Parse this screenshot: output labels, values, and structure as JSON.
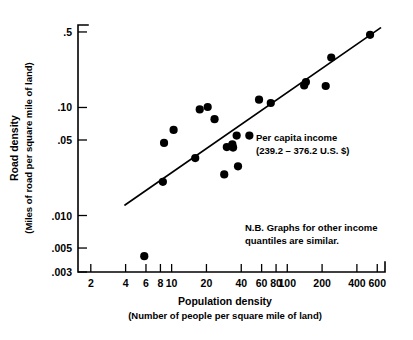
{
  "chart_data": {
    "type": "scatter",
    "title": "",
    "xlabel": "Population density",
    "xlabel_sub": "(Number of people per square mile of land)",
    "ylabel": "Road density",
    "ylabel_sub": "(Miles of road per square mile of land)",
    "xscale": "log",
    "yscale": "log",
    "xlim": [
      1.55,
      700
    ],
    "ylim": [
      0.003,
      0.58
    ],
    "grid": false,
    "legend": "none",
    "xticks": [
      {
        "value": 2,
        "label": "2"
      },
      {
        "value": 4,
        "label": "4"
      },
      {
        "value": 6,
        "label": "6"
      },
      {
        "value": 8,
        "label": "8"
      },
      {
        "value": 10,
        "label": "10"
      },
      {
        "value": 20,
        "label": "20"
      },
      {
        "value": 40,
        "label": "40"
      },
      {
        "value": 60,
        "label": "60"
      },
      {
        "value": 80,
        "label": "80"
      },
      {
        "value": 100,
        "label": "100"
      },
      {
        "value": 200,
        "label": "200"
      },
      {
        "value": 400,
        "label": "400"
      },
      {
        "value": 600,
        "label": "600"
      }
    ],
    "yticks": [
      {
        "value": 0.5,
        "label": ".5"
      },
      {
        "value": 0.1,
        "label": ".10"
      },
      {
        "value": 0.05,
        "label": ".05"
      },
      {
        "value": 0.01,
        "label": ".010"
      },
      {
        "value": 0.005,
        "label": ".005"
      },
      {
        "value": 0.003,
        "label": ".003"
      }
    ],
    "series": [
      {
        "name": "countries",
        "marker": "filled-circle",
        "color": "#000000",
        "points": [
          {
            "x": 5.8,
            "y": 0.0042
          },
          {
            "x": 8.4,
            "y": 0.0205
          },
          {
            "x": 8.6,
            "y": 0.047
          },
          {
            "x": 10.4,
            "y": 0.062
          },
          {
            "x": 16.0,
            "y": 0.034
          },
          {
            "x": 17.5,
            "y": 0.096
          },
          {
            "x": 20.5,
            "y": 0.101
          },
          {
            "x": 23.5,
            "y": 0.078
          },
          {
            "x": 28.5,
            "y": 0.024
          },
          {
            "x": 30.0,
            "y": 0.043
          },
          {
            "x": 33.5,
            "y": 0.0455
          },
          {
            "x": 34.0,
            "y": 0.0425
          },
          {
            "x": 36.5,
            "y": 0.055
          },
          {
            "x": 37.5,
            "y": 0.0285
          },
          {
            "x": 47.0,
            "y": 0.055
          },
          {
            "x": 57.0,
            "y": 0.118
          },
          {
            "x": 72.0,
            "y": 0.11
          },
          {
            "x": 140.0,
            "y": 0.16
          },
          {
            "x": 145.0,
            "y": 0.172
          },
          {
            "x": 215.0,
            "y": 0.158
          },
          {
            "x": 240.0,
            "y": 0.29
          },
          {
            "x": 520.0,
            "y": 0.47
          }
        ]
      }
    ],
    "trend_line": {
      "name": "fitted-regression-line",
      "x_start": 3.95,
      "y_start": 0.0125,
      "x_end": 640,
      "y_end": 0.545
    },
    "annotations": [
      {
        "name": "per-capita-income-note",
        "lines": [
          "Per capita income",
          "(239.2 – 376.2 U.S. $)"
        ],
        "x": 256,
        "y": 141
      },
      {
        "name": "quantiles-note",
        "lines": [
          "N.B. Graphs for other income",
          "quantiles are similar."
        ],
        "x": 245,
        "y": 231
      }
    ]
  }
}
